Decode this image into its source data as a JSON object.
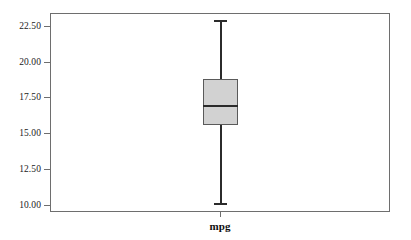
{
  "chart_data": {
    "type": "box",
    "title": "",
    "subtitle": "",
    "xlabel": "",
    "ylabel": "",
    "grid": false,
    "legend": false,
    "categories": [
      "mpg"
    ],
    "x_tick_labels": [
      "mpg"
    ],
    "y_tick_labels": [
      "22.50",
      "20.00",
      "17.50",
      "15.00",
      "12.50",
      "10.00"
    ],
    "y_tick_values": [
      22.5,
      20.0,
      17.5,
      15.0,
      12.5,
      10.0
    ],
    "ylim": [
      9.5,
      23.4
    ],
    "series": [
      {
        "name": "mpg",
        "whisker_high": 22.9,
        "q3": 18.8,
        "median": 17.0,
        "q1": 15.6,
        "whisker_low": 10.1,
        "outliers": []
      }
    ],
    "colors": {
      "box_fill": "#d2d2d2",
      "box_border": "#5a5a5a",
      "whisker": "#2b2b2b",
      "median": "#2b2b2b",
      "frame": "#6e6e6e",
      "tick_label": "#1a1a1a",
      "axis_label": "#0f0f0f",
      "background": "#ffffff"
    }
  },
  "axis": {
    "y_ticks": [
      {
        "label": "22.50",
        "value": 22.5
      },
      {
        "label": "20.00",
        "value": 20.0
      },
      {
        "label": "17.50",
        "value": 17.5
      },
      {
        "label": "15.00",
        "value": 15.0
      },
      {
        "label": "12.50",
        "value": 12.5
      },
      {
        "label": "10.00",
        "value": 10.0
      }
    ],
    "x_ticks": [
      {
        "label": "mpg"
      }
    ]
  }
}
